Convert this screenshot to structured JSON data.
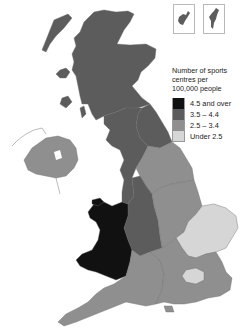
{
  "legend": {
    "title_lines": [
      "Number of sports",
      "centres per",
      "100,000 people"
    ],
    "items": [
      {
        "label": "4.5 and over",
        "color": "#111111"
      },
      {
        "label": "3.5 – 4.4",
        "color": "#5c5c5c"
      },
      {
        "label": "2.5 – 3.4",
        "color": "#8f8f8f"
      },
      {
        "label": "Under 2.5",
        "color": "#d6d6d6"
      }
    ]
  },
  "insets": [
    {
      "name": "Orkney",
      "category": "3.5 – 4.4"
    },
    {
      "name": "Shetland",
      "category": "3.5 – 4.4"
    }
  ],
  "regions": [
    {
      "name": "Scotland",
      "category": "3.5 – 4.4",
      "color": "#5c5c5c"
    },
    {
      "name": "North East",
      "category": "3.5 – 4.4",
      "color": "#5c5c5c"
    },
    {
      "name": "North West",
      "category": "3.5 – 4.4",
      "color": "#5c5c5c"
    },
    {
      "name": "West Midlands",
      "category": "3.5 – 4.4",
      "color": "#5c5c5c"
    },
    {
      "name": "Wales",
      "category": "4.5 and over",
      "color": "#111111"
    },
    {
      "name": "Northern Ireland",
      "category": "2.5 – 3.4",
      "color": "#8f8f8f"
    },
    {
      "name": "Yorkshire and the Humber",
      "category": "2.5 – 3.4",
      "color": "#8f8f8f"
    },
    {
      "name": "East Midlands",
      "category": "2.5 – 3.4",
      "color": "#8f8f8f"
    },
    {
      "name": "South West",
      "category": "2.5 – 3.4",
      "color": "#8f8f8f"
    },
    {
      "name": "South East",
      "category": "2.5 – 3.4",
      "color": "#8f8f8f"
    },
    {
      "name": "East of England",
      "category": "Under 2.5",
      "color": "#d6d6d6"
    },
    {
      "name": "London",
      "category": "Under 2.5",
      "color": "#d6d6d6"
    }
  ]
}
